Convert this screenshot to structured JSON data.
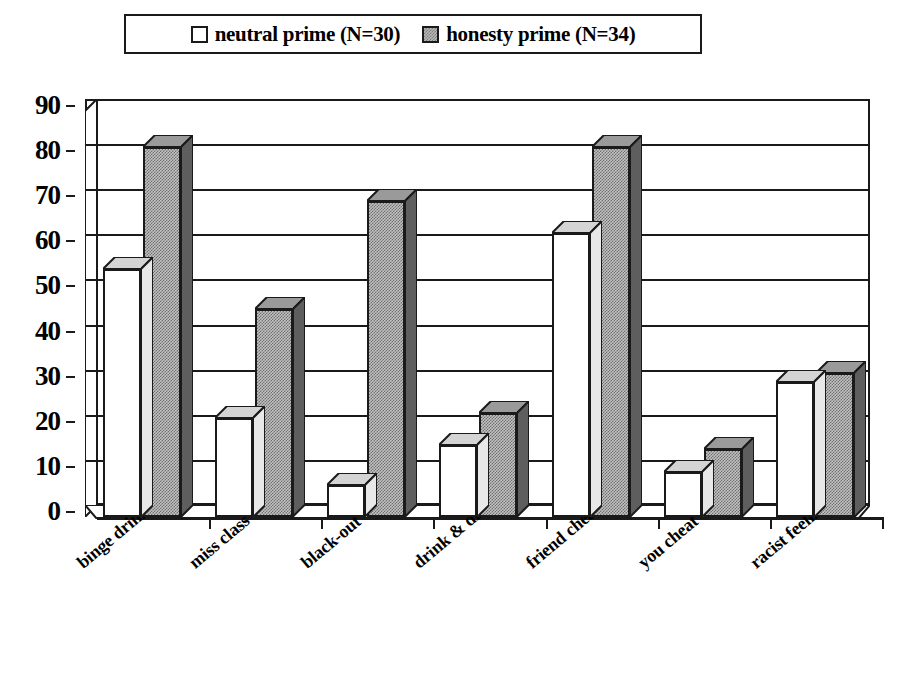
{
  "legend": {
    "entries": [
      {
        "label": "neutral prime (N=30)",
        "swatch": "white-square-swatch"
      },
      {
        "label": "honesty prime (N=34)",
        "swatch": "gray-checkered-square-swatch"
      }
    ]
  },
  "colors": {
    "outline": "#1a1a1a",
    "neutral_prime_fill": "#ffffff",
    "honesty_prime_fill": "#c2c2c2",
    "background": "#ffffff"
  },
  "chart_data": {
    "type": "bar",
    "title": "",
    "subtitle": "",
    "xlabel": "",
    "ylabel": "",
    "ylim": [
      0,
      90
    ],
    "yticks": [
      0,
      10,
      20,
      30,
      40,
      50,
      60,
      70,
      80,
      90
    ],
    "ytick_labels": [
      "0",
      "10",
      "20",
      "30",
      "40",
      "50",
      "60",
      "70",
      "80",
      "90"
    ],
    "grid": true,
    "legend_position": "top",
    "style": "3d-clustered-columns",
    "categories": [
      "binge drinking",
      "miss class",
      "black-out",
      "drink & drive",
      "friend cheat",
      "you cheat",
      "racist feelings"
    ],
    "series": [
      {
        "name": "neutral prime (N=30)",
        "values": [
          55,
          22,
          7,
          16,
          63,
          10,
          30
        ]
      },
      {
        "name": "honesty prime (N=34)",
        "values": [
          82,
          46,
          70,
          23,
          82,
          15,
          32
        ]
      }
    ]
  }
}
